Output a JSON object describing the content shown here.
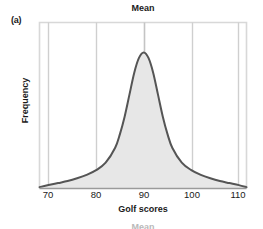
{
  "figure": {
    "panel_label": "(a)",
    "title": "Mean",
    "ghost_label": "Mean"
  },
  "axes": {
    "x_title": "Golf scores",
    "y_title": "Frequency"
  },
  "colors": {
    "curve_stroke": "#555555",
    "curve_fill": "#e7e7e7",
    "gridline": "#cfcfcf",
    "frame": "#d8d8d8",
    "text": "#1a1a1a",
    "background": "#ffffff"
  },
  "chart_data": {
    "type": "line",
    "title": "Mean",
    "xlabel": "Golf scores",
    "ylabel": "Frequency",
    "xlim": [
      68.1,
      111.6
    ],
    "ylim": [
      0,
      1
    ],
    "grid": true,
    "legend": null,
    "annotations": [
      {
        "label": "Mean",
        "x": 90,
        "type": "vertical-reference-line"
      },
      {
        "label": "(a)",
        "type": "panel-letter"
      }
    ],
    "x_ticks": [
      70,
      80,
      90,
      100,
      110
    ],
    "y_ticks": [],
    "series": [
      {
        "name": "Golf score distribution",
        "note": "Symmetric unimodal heavy-tailed density centred on the mean of 90",
        "x": [
          68.1,
          70,
          72,
          74,
          76,
          78,
          80,
          82,
          84,
          85,
          86,
          87,
          88,
          89,
          90,
          91,
          92,
          93,
          94,
          95,
          96,
          98,
          100,
          102,
          104,
          106,
          108,
          110,
          111.6
        ],
        "y": [
          0.01,
          0.025,
          0.04,
          0.055,
          0.075,
          0.1,
          0.135,
          0.19,
          0.3,
          0.4,
          0.53,
          0.69,
          0.85,
          0.96,
          1.0,
          0.96,
          0.85,
          0.69,
          0.53,
          0.4,
          0.3,
          0.19,
          0.135,
          0.1,
          0.075,
          0.055,
          0.04,
          0.025,
          0.01
        ]
      }
    ]
  }
}
